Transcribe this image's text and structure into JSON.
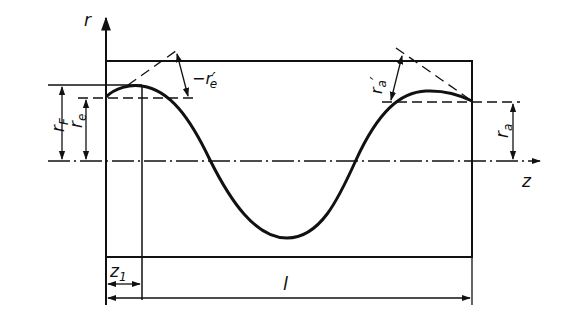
{
  "diagram": {
    "axes": {
      "vertical_label": "r",
      "horizontal_label": "z"
    },
    "labels": {
      "r_F": "r",
      "r_F_sub": "F",
      "r_e": "r",
      "r_e_sub": "e",
      "r_e_prime": "−r",
      "r_e_prime_sub": "e",
      "r_e_prime_mark": "′",
      "r_a": "r",
      "r_a_sub": "a",
      "r_a_prime": "r",
      "r_a_prime_sub": "a",
      "r_a_prime_mark": "′",
      "z1": "z",
      "z1_sub": "1",
      "length": "l"
    },
    "colors": {
      "ink": "#111111",
      "background": "#ffffff"
    }
  }
}
